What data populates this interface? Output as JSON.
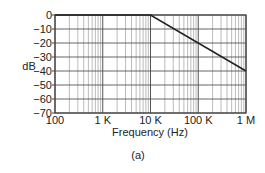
{
  "chart_data": {
    "type": "line",
    "title": "",
    "caption": "(a)",
    "xlabel": "Frequency (Hz)",
    "ylabel": "dB",
    "xscale": "log",
    "xlim": [
      100,
      1000000
    ],
    "ylim": [
      -70,
      0
    ],
    "grid": true,
    "x_ticks": [
      {
        "value": 100,
        "label": "100"
      },
      {
        "value": 1000,
        "label": "1 K"
      },
      {
        "value": 10000,
        "label": "10 K"
      },
      {
        "value": 100000,
        "label": "100 K"
      },
      {
        "value": 1000000,
        "label": "1 M"
      }
    ],
    "y_ticks": [
      {
        "value": 0,
        "label": "0"
      },
      {
        "value": -10,
        "label": "−10"
      },
      {
        "value": -20,
        "label": "−20"
      },
      {
        "value": -30,
        "label": "−30"
      },
      {
        "value": -40,
        "label": "−40"
      },
      {
        "value": -50,
        "label": "−50"
      },
      {
        "value": -60,
        "label": "−60"
      },
      {
        "value": -70,
        "label": "−70"
      }
    ],
    "series": [
      {
        "name": "Magnitude response",
        "x": [
          100,
          10000,
          1000000
        ],
        "y": [
          0,
          0,
          -40
        ]
      }
    ],
    "annotations": [],
    "colors": {
      "line": "#222222",
      "major_grid": "#555555",
      "minor_grid": "#aaaaaa",
      "frame": "#444444"
    }
  }
}
